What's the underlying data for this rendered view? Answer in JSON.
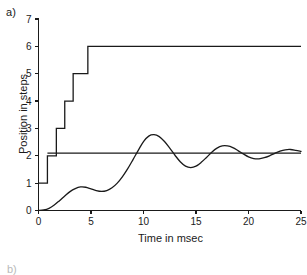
{
  "figure": {
    "panel_label": "a)",
    "next_panel_label": "b)"
  },
  "chart_data": {
    "type": "line",
    "title": "",
    "xlabel": "Time in msec",
    "ylabel": "Position in steps",
    "xlim": [
      0,
      25
    ],
    "ylim": [
      0,
      7
    ],
    "xticks": [
      0,
      5,
      10,
      15,
      20,
      25
    ],
    "yticks": [
      0,
      1,
      2,
      3,
      4,
      5,
      6,
      7
    ],
    "xtick_labels": [
      "0",
      "5",
      "10",
      "15",
      "20",
      "25"
    ],
    "ytick_labels": [
      "0",
      "1",
      "2",
      "3",
      "4",
      "5",
      "6",
      "7"
    ],
    "grid": false,
    "legend": null,
    "series": [
      {
        "name": "command-staircase",
        "type": "step",
        "description": "Staircase command signal rising from 1 to 6 steps",
        "points": [
          [
            0.0,
            1.0
          ],
          [
            0.85,
            1.0
          ],
          [
            0.85,
            2.0
          ],
          [
            1.7,
            2.0
          ],
          [
            1.7,
            3.0
          ],
          [
            2.5,
            3.0
          ],
          [
            2.5,
            4.0
          ],
          [
            3.3,
            4.0
          ],
          [
            3.3,
            5.0
          ],
          [
            4.7,
            5.0
          ],
          [
            4.7,
            6.0
          ],
          [
            25.0,
            6.0
          ]
        ]
      },
      {
        "name": "reference-level",
        "type": "line",
        "description": "Horizontal reference line at about 2.1 steps",
        "points": [
          [
            0.85,
            2.1
          ],
          [
            25.0,
            2.1
          ]
        ]
      },
      {
        "name": "damped-response",
        "type": "line",
        "description": "Damped oscillatory position response settling near 2.1 steps",
        "points": [
          [
            0.0,
            0.0
          ],
          [
            0.5,
            0.02
          ],
          [
            1.0,
            0.08
          ],
          [
            1.5,
            0.2
          ],
          [
            2.0,
            0.36
          ],
          [
            2.5,
            0.53
          ],
          [
            3.0,
            0.69
          ],
          [
            3.5,
            0.8
          ],
          [
            4.0,
            0.86
          ],
          [
            4.5,
            0.85
          ],
          [
            5.0,
            0.79
          ],
          [
            5.5,
            0.73
          ],
          [
            6.0,
            0.7
          ],
          [
            6.5,
            0.73
          ],
          [
            7.0,
            0.83
          ],
          [
            7.5,
            1.0
          ],
          [
            8.0,
            1.24
          ],
          [
            8.5,
            1.53
          ],
          [
            9.0,
            1.86
          ],
          [
            9.5,
            2.2
          ],
          [
            10.0,
            2.52
          ],
          [
            10.5,
            2.72
          ],
          [
            11.0,
            2.77
          ],
          [
            11.5,
            2.7
          ],
          [
            12.0,
            2.52
          ],
          [
            12.5,
            2.28
          ],
          [
            13.0,
            2.02
          ],
          [
            13.5,
            1.78
          ],
          [
            14.0,
            1.62
          ],
          [
            14.5,
            1.57
          ],
          [
            15.0,
            1.62
          ],
          [
            15.5,
            1.76
          ],
          [
            16.0,
            1.94
          ],
          [
            16.5,
            2.13
          ],
          [
            17.0,
            2.28
          ],
          [
            17.5,
            2.36
          ],
          [
            18.0,
            2.36
          ],
          [
            18.5,
            2.3
          ],
          [
            19.0,
            2.19
          ],
          [
            19.5,
            2.07
          ],
          [
            20.0,
            1.96
          ],
          [
            20.5,
            1.9
          ],
          [
            21.0,
            1.89
          ],
          [
            21.5,
            1.93
          ],
          [
            22.0,
            2.0
          ],
          [
            22.5,
            2.09
          ],
          [
            23.0,
            2.17
          ],
          [
            23.5,
            2.22
          ],
          [
            24.0,
            2.23
          ],
          [
            24.5,
            2.2
          ],
          [
            25.0,
            2.16
          ]
        ]
      }
    ]
  }
}
